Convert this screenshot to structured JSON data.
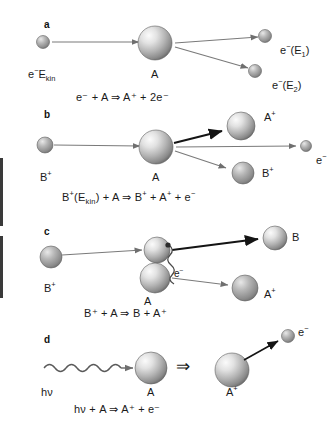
{
  "figure": {
    "background": "#ffffff",
    "sphere_fill_light": "#f2f2f2",
    "sphere_fill_dark": "#6e6e6e",
    "arrow_gray": "#7a7a7a",
    "arrow_black": "#1a1a1a"
  },
  "panels": {
    "a": {
      "letter": "a",
      "mechanism": "electron impact ionization",
      "incoming_label_pre": "e",
      "incoming_label_sup": "−",
      "incoming_label_post": "E",
      "incoming_label_sub": "kin",
      "target_label": "A",
      "out1_pre": "e",
      "out1_sup": "−",
      "out1_post": "(E",
      "out1_sub": "1",
      "out1_tail": ")",
      "out2_pre": "e",
      "out2_sup": "−",
      "out2_post": "(E",
      "out2_sub": "2",
      "out2_tail": ")",
      "equation": "e⁻ + A ⇒ A⁺ + 2e⁻"
    },
    "b": {
      "letter": "b",
      "mechanism": "ion impact ionization",
      "incoming_label": "B",
      "incoming_sup": "+",
      "target_label": "A",
      "out_ion_label": "A",
      "out_ion_sup": "+",
      "out_proj_label": "B",
      "out_proj_sup": "+",
      "out_elec_label": "e",
      "out_elec_sup": "−",
      "equation": "B⁺(E_kin) + A ⇒ B⁺ + A⁺ + e⁻"
    },
    "c": {
      "letter": "c",
      "mechanism": "charge transfer",
      "incoming_label": "B",
      "incoming_sup": "+",
      "target_label": "A",
      "transfer_label": "e",
      "transfer_sup": "−",
      "out_neutral_label": "B",
      "out_ion_label": "A",
      "out_ion_sup": "+",
      "equation": "B⁺ + A ⇒ B + A⁺"
    },
    "d": {
      "letter": "d",
      "mechanism": "photoionization",
      "photon_label_pre": "h",
      "photon_label_post": "ν",
      "target_label": "A",
      "implies_symbol": "⇒",
      "product_label": "A",
      "product_sup": "+",
      "out_elec_label": "e",
      "out_elec_sup": "−",
      "equation": "hν + A ⇒ A⁺ + e⁻"
    }
  }
}
